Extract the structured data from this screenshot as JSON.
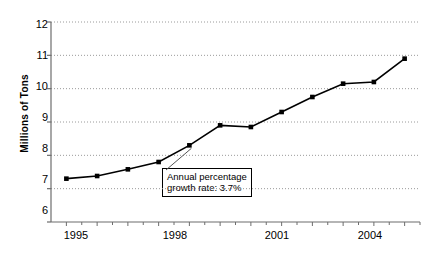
{
  "chart_data": {
    "type": "line",
    "title": "",
    "xlabel": "",
    "ylabel": "Millions of Tons",
    "ylim": [
      6,
      12
    ],
    "yticks": [
      6,
      7,
      8,
      9,
      10,
      11,
      12
    ],
    "ytick_labels": [
      "6",
      "7",
      "8",
      "9",
      "10",
      "11",
      "12"
    ],
    "xlim": [
      1994.5,
      2006.5
    ],
    "xticks_major": [
      1995,
      1998,
      2001,
      2004
    ],
    "xtick_labels": [
      "1995",
      "1998",
      "2001",
      "2004"
    ],
    "xtick_minor_interval": 0.5,
    "grid": "horizontal-dotted",
    "legend": "none",
    "marker": "filled-square",
    "line_color": "#000000",
    "grid_color": "#9a9a9a",
    "axis_color": "#6d6d6d",
    "x": [
      1995,
      1996,
      1997,
      1998,
      1999,
      2000,
      2001,
      2002,
      2003,
      2004,
      2005,
      2006
    ],
    "values": [
      7.3,
      7.38,
      7.58,
      7.8,
      8.3,
      8.9,
      8.85,
      9.3,
      9.75,
      10.15,
      10.2,
      10.9
    ],
    "series": [
      {
        "name": "Millions of Tons",
        "values": [
          7.3,
          7.38,
          7.58,
          7.8,
          8.3,
          8.9,
          8.85,
          9.3,
          9.75,
          10.15,
          10.2,
          10.9
        ]
      }
    ],
    "annotations": [
      {
        "name": "growth-rate-callout",
        "line1": "Annual percentage",
        "line2": "growth rate: 3.7%",
        "points_to_year": 1999,
        "points_to_value": 8.3
      }
    ]
  }
}
